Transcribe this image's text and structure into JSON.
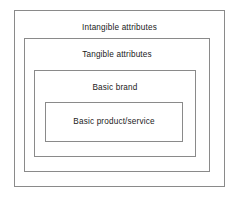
{
  "diagram": {
    "type": "concentric-nested-rectangles",
    "background_color": "#ffffff",
    "border_color": "#8a8a8a",
    "text_color": "#1a1a1a",
    "layers": [
      {
        "level": 1,
        "name": "intangible-attributes",
        "label": "Intangible attributes",
        "position": "outermost"
      },
      {
        "level": 2,
        "name": "tangible-attributes",
        "label": "Tangible attributes",
        "position": "second"
      },
      {
        "level": 3,
        "name": "basic-brand",
        "label": "Basic brand",
        "position": "third"
      },
      {
        "level": 4,
        "name": "basic-product-service",
        "label": "Basic product/service",
        "position": "innermost"
      }
    ]
  }
}
